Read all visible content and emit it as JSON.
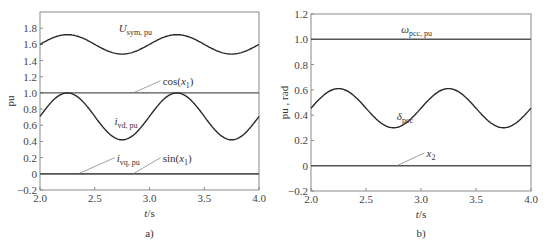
{
  "chart_data": [
    {
      "panel": "a)",
      "type": "line",
      "xlabel": "t/s",
      "ylabel": "pu",
      "xlim": [
        2.0,
        4.0
      ],
      "ylim": [
        -0.2,
        2.0
      ],
      "xticks": [
        "2.0",
        "2.5",
        "3.0",
        "3.5",
        "4.0"
      ],
      "yticks": [
        "-0.2",
        "0",
        "0.2",
        "0.4",
        "0.6",
        "0.8",
        "1.0",
        "1.2",
        "1.4",
        "1.6",
        "1.8"
      ],
      "grid": false,
      "series": [
        {
          "name": "U_sym,pu",
          "label_main": "U",
          "label_sub": "sym, pu",
          "form": "sine",
          "mean": 1.6,
          "amplitude": 0.12,
          "period": 1.0,
          "peak_t": 2.25,
          "label_pos": [
            2.72,
            1.75
          ]
        },
        {
          "name": "cos(x1)",
          "label_main": "cos(x",
          "label_sub": "1",
          "label_tail": ")",
          "form": "constant",
          "value": 1.0,
          "label_pos": [
            3.12,
            1.1
          ],
          "leader_to": [
            2.85,
            1.0
          ]
        },
        {
          "name": "i_vd,pu",
          "label_main": "i",
          "label_sub": "vd, pu",
          "form": "sine",
          "mean": 0.71,
          "amplitude": 0.29,
          "period": 1.0,
          "peak_t": 2.25,
          "label_pos": [
            2.68,
            0.6
          ]
        },
        {
          "name": "i_vq,pu",
          "label_main": "i",
          "label_sub": "vq, pu",
          "form": "constant",
          "value": 0.0,
          "label_pos": [
            2.7,
            0.15
          ],
          "leader_to": [
            2.35,
            0.0
          ]
        },
        {
          "name": "sin(x1)",
          "label_main": "sin(x",
          "label_sub": "1",
          "label_tail": ")",
          "form": "constant",
          "value": 0.0,
          "label_pos": [
            3.12,
            0.15
          ],
          "leader_to": [
            2.85,
            0.0
          ]
        }
      ]
    },
    {
      "panel": "b)",
      "type": "line",
      "xlabel": "t/s",
      "ylabel": "pu , rad",
      "xlim": [
        2.0,
        4.0
      ],
      "ylim": [
        -0.2,
        1.2
      ],
      "xticks": [
        "2.0",
        "2.5",
        "3.0",
        "3.5",
        "4.0"
      ],
      "yticks": [
        "-0.2",
        "0",
        "0.2",
        "0.4",
        "0.6",
        "0.8",
        "1.0",
        "1.2"
      ],
      "grid": false,
      "series": [
        {
          "name": "ω_pcc,pu",
          "label_main": "ω",
          "label_sub": "pcc, pu",
          "form": "constant",
          "value": 1.0,
          "label_pos": [
            2.82,
            1.05
          ]
        },
        {
          "name": "δ_pcc",
          "label_main": "δ",
          "label_sub": "pcc",
          "form": "sine",
          "mean": 0.455,
          "amplitude": 0.155,
          "period": 1.0,
          "peak_t": 2.25,
          "label_pos": [
            2.78,
            0.36
          ]
        },
        {
          "name": "x2",
          "label_main": "x",
          "label_sub": "2",
          "form": "constant",
          "value": 0.0,
          "label_pos": [
            3.05,
            0.07
          ],
          "leader_to": [
            2.78,
            0.0
          ]
        }
      ]
    }
  ],
  "colors": {
    "axis": "#8a8a8a",
    "curve": "#3a3a3a",
    "text": "#333333"
  }
}
